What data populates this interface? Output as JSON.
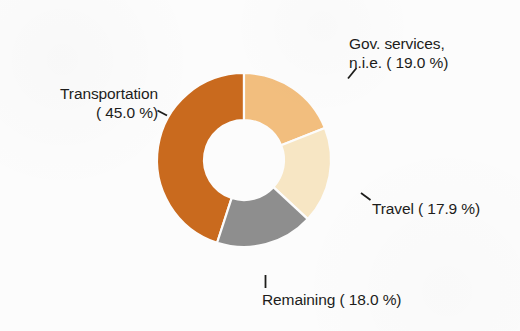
{
  "background_color": "#fcfcfc",
  "text_color": "#1d1d1b",
  "chart_data": {
    "type": "pie",
    "variant": "donut",
    "title": "",
    "subtitle": "",
    "xlabel": "",
    "ylabel": "",
    "legend_position": "none",
    "labels_position": "outside-with-leader-lines",
    "grid": false,
    "start_angle_deg": 0,
    "direction": "clockwise",
    "units": "%",
    "total": 99.9,
    "center": {
      "x": 244,
      "y": 160
    },
    "outer_radius": 87,
    "inner_radius": 40,
    "categories": [
      "Transportation",
      "Gov. services, n.i.e.",
      "Travel",
      "Remaining"
    ],
    "values": [
      45.0,
      19.0,
      17.9,
      18.0
    ],
    "colors": [
      "#c96a1e",
      "#f2be7e",
      "#f7e6c4",
      "#8e8e8e"
    ],
    "slices": [
      {
        "name": "Transportation",
        "value": 45.0,
        "value_text": "45.0",
        "label_line_1": "Transportation",
        "label_line_2": "( 45.0 %)",
        "color": "#c96a1e",
        "start_deg": 198.0,
        "end_deg": 360.0
      },
      {
        "name": "Gov. services, n.i.e.",
        "value": 19.0,
        "value_text": "19.0",
        "label_line_1": "Gov. services,",
        "label_line_2": "n.i.e. ( 19.0 %)",
        "color": "#f2be7e",
        "start_deg": 0.0,
        "end_deg": 68.4
      },
      {
        "name": "Travel",
        "value": 17.9,
        "value_text": "17.9",
        "label_line_1": "Travel ( 17.9 %)",
        "label_line_2": "",
        "color": "#f7e6c4",
        "start_deg": 68.4,
        "end_deg": 132.8
      },
      {
        "name": "Remaining",
        "value": 18.0,
        "value_text": "18.0",
        "label_line_1": "Remaining ( 18.0 %)",
        "label_line_2": "",
        "color": "#8e8e8e",
        "start_deg": 132.8,
        "end_deg": 198.0
      }
    ]
  }
}
